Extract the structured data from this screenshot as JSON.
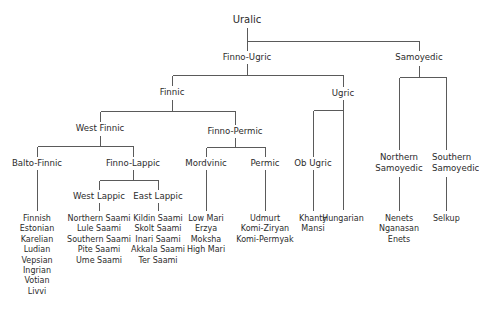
{
  "diagram": {
    "type": "tree",
    "title": "Uralic",
    "nodes": {
      "uralic": "Uralic",
      "finno_ugric": "Finno-Ugric",
      "samoyedic": "Samoyedic",
      "finnic": "Finnic",
      "ugric": "Ugric",
      "west_finnic": "West Finnic",
      "finno_permic": "Finno-Permic",
      "balto_finnic": "Balto-Finnic",
      "finno_lappic": "Finno-Lappic",
      "west_lappic": "West Lappic",
      "east_lappic": "East Lappic",
      "mordvinic": "Mordvinic",
      "permic": "Permic",
      "ob_ugric": "Ob Ugric",
      "northern_samoyedic_1": "Northern",
      "northern_samoyedic_2": "Samoyedic",
      "southern_samoyedic_1": "Southern",
      "southern_samoyedic_2": "Samoyedic"
    },
    "leaves": {
      "balto_finnic": [
        "Finnish",
        "Estonian",
        "Karelian",
        "Ludian",
        "Vepsian",
        "Ingrian",
        "Votian",
        "Livvi"
      ],
      "west_lappic": [
        "Northern Saami",
        "Lule Saami",
        "Southern Saami",
        "Pite Saami",
        "Ume Saami"
      ],
      "east_lappic": [
        "Kildin Saami",
        "Skolt Saami",
        "Inari Saami",
        "Akkala Saami",
        "Ter Saami"
      ],
      "mordvinic": [
        "Low Mari",
        "Erzya",
        "Moksha",
        "High Mari"
      ],
      "permic": [
        "Udmurt",
        "Komi-Ziryan",
        "Komi-Permyak"
      ],
      "ob_ugric": [
        "Khanty",
        "Mansi"
      ],
      "hungarian": [
        "Hungarian"
      ],
      "northern_samoyedic": [
        "Nenets",
        "Nganasan",
        "Enets"
      ],
      "southern_samoyedic": [
        "Selkup"
      ]
    },
    "line_color": "#555555"
  }
}
